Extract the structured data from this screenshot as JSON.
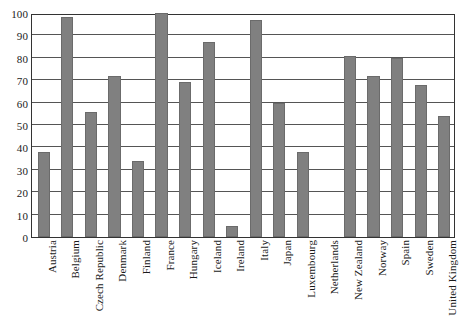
{
  "chart_data": {
    "type": "bar",
    "title": "",
    "xlabel": "",
    "ylabel": "",
    "ylim": [
      0,
      100
    ],
    "ytick_step": 10,
    "yticks": [
      100,
      90,
      80,
      70,
      60,
      50,
      40,
      30,
      20,
      10,
      0
    ],
    "grid": true,
    "legend": "none",
    "bar_color": "#808080",
    "bar_edge_color": "#6b6b6b",
    "axis_color": "#333333",
    "gridline_color": "#555555",
    "categories": [
      "Austria",
      "Belgium",
      "Czech Republic",
      "Denmark",
      "Finland",
      "France",
      "Hungary",
      "Iceland",
      "Ireland",
      "Italy",
      "Japan",
      "Luxembourg",
      "Netherlands",
      "New Zealand",
      "Norway",
      "Spain",
      "Sweden",
      "United Kingdom"
    ],
    "values": [
      38,
      98,
      56,
      72,
      34,
      100,
      69,
      87,
      5,
      97,
      60,
      38,
      0,
      81,
      72,
      80,
      68,
      54
    ]
  }
}
